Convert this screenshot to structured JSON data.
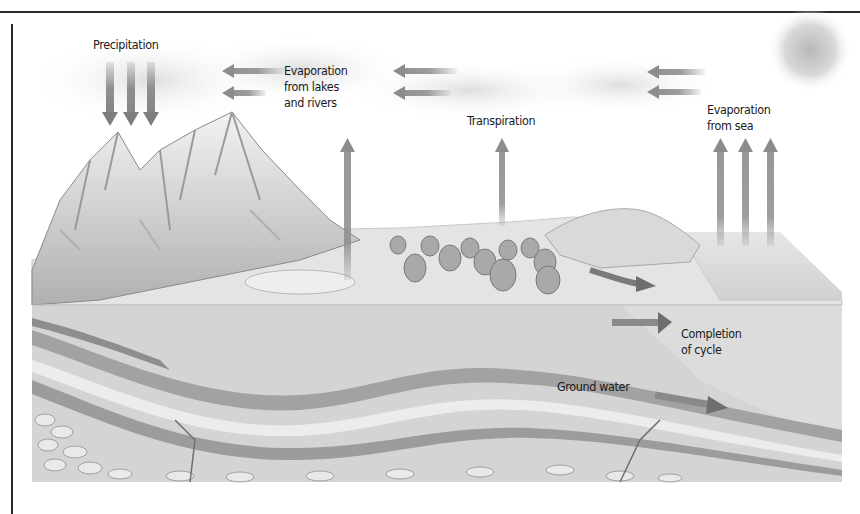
{
  "figure": {
    "type": "water-cycle-diagram",
    "colors": {
      "arrow": "#8c8c8c",
      "sky": "#f4f4f4",
      "land_surface": "#dcdcdc",
      "rock_layer_dark": "#9a9a9a",
      "rock_layer_light": "#e2e2e2",
      "sea_surface": "#d6d6d6",
      "text": "#1a1a1a",
      "rule": "#2a2a2a"
    },
    "labels": {
      "precipitation": "Precipitation",
      "evaporation_lakes": "Evaporation\nfrom lakes\nand rivers",
      "transpiration": "Transpiration",
      "evaporation_sea": "Evaporation\nfrom sea",
      "completion": "Completion\nof cycle",
      "ground_water": "Ground water"
    },
    "elements": {
      "sun": "sun",
      "mountains": "snow-capped mountains",
      "forest": "trees",
      "lake": "lake",
      "sea": "sea",
      "strata": "underground rock layers"
    }
  }
}
